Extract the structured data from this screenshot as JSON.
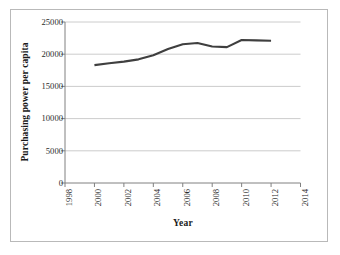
{
  "chart_data": {
    "type": "line",
    "title": "",
    "xlabel": "Year",
    "ylabel": "Purchasing power per capita",
    "xlim": [
      1998,
      2014
    ],
    "ylim": [
      0,
      25000
    ],
    "grid": true,
    "legend": false,
    "x_ticks": [
      "1998",
      "2000",
      "2002",
      "2004",
      "2006",
      "2008",
      "2010",
      "2012",
      "2014"
    ],
    "y_ticks": [
      "0",
      "5000",
      "10000",
      "15000",
      "20000",
      "25000"
    ],
    "y_tick_values": [
      0,
      5000,
      10000,
      15000,
      20000,
      25000
    ],
    "series": [
      {
        "name": "Purchasing power per capita",
        "color": "#3f3f3f",
        "x": [
          2000,
          2001,
          2002,
          2003,
          2004,
          2005,
          2006,
          2007,
          2008,
          2009,
          2010,
          2011,
          2012
        ],
        "values": [
          18300,
          18600,
          18850,
          19200,
          19850,
          20800,
          21550,
          21750,
          21200,
          21100,
          22200,
          22150,
          22100
        ]
      }
    ]
  },
  "axis": {
    "y_title": "Purchasing power per capita",
    "x_title": "Year"
  },
  "colors": {
    "line": "#3f3f3f",
    "grid": "#bfbfbf",
    "axis": "#808080",
    "border": "#b9b9b9",
    "text": "#2b2b2b"
  }
}
